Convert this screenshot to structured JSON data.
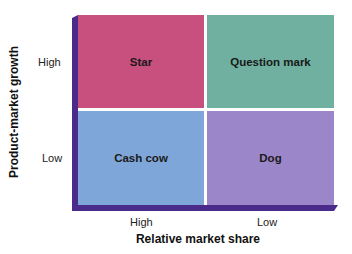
{
  "diagram": {
    "y_axis": {
      "label": "Product-market growth",
      "ticks": [
        "High",
        "Low"
      ]
    },
    "x_axis": {
      "label": "Relative market share",
      "ticks": [
        "High",
        "Low"
      ]
    },
    "quadrants": [
      {
        "label": "Star",
        "position": "top-left",
        "color": "#c8507e"
      },
      {
        "label": "Question mark",
        "position": "top-right",
        "color": "#6fb0a0"
      },
      {
        "label": "Cash cow",
        "position": "bottom-left",
        "color": "#7fa6d8"
      },
      {
        "label": "Dog",
        "position": "bottom-right",
        "color": "#9a86c8"
      }
    ],
    "edge_color": "#4a2a8a",
    "divider_color": "#ffffff"
  }
}
